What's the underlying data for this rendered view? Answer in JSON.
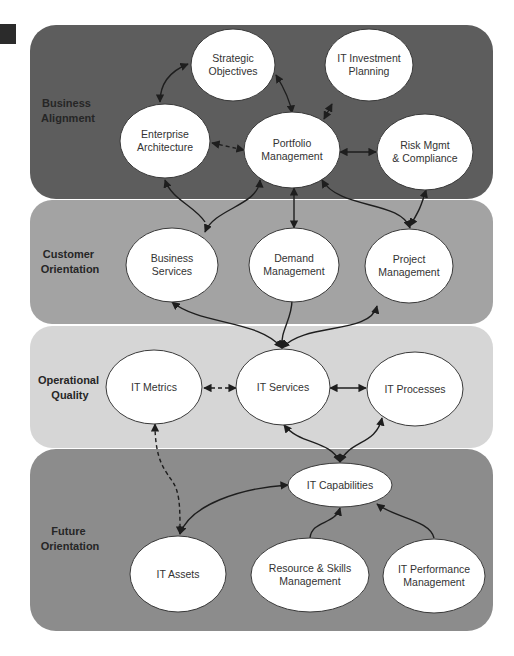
{
  "page": {
    "header_text": "Enterprise IT Management"
  },
  "colors": {
    "band_business": "#5d5d5d",
    "band_customer": "#a3a3a3",
    "band_operational": "#d6d6d6",
    "band_future": "#8c8c8c",
    "node_fill": "#ffffff",
    "arrow": "#1e1e1e"
  },
  "bands": [
    {
      "id": "business",
      "label_lines": [
        "Business",
        "Alignment"
      ]
    },
    {
      "id": "customer",
      "label_lines": [
        "Customer",
        "Orientation"
      ]
    },
    {
      "id": "operational",
      "label_lines": [
        "Operational",
        "Quality"
      ]
    },
    {
      "id": "future",
      "label_lines": [
        "Future",
        "Orientation"
      ]
    }
  ],
  "nodes": {
    "strategic_objectives": {
      "lines": [
        "Strategic",
        "Objectives"
      ]
    },
    "it_investment_planning": {
      "lines": [
        "IT Investment",
        "Planning"
      ]
    },
    "enterprise_architecture": {
      "lines": [
        "Enterprise",
        "Architecture"
      ]
    },
    "portfolio_management": {
      "lines": [
        "Portfolio",
        "Management"
      ]
    },
    "risk_mgmt_compliance": {
      "lines": [
        "Risk Mgmt",
        "& Compliance"
      ]
    },
    "business_services": {
      "lines": [
        "Business",
        "Services"
      ]
    },
    "demand_management": {
      "lines": [
        "Demand",
        "Management"
      ]
    },
    "project_management": {
      "lines": [
        "Project",
        "Management"
      ]
    },
    "it_metrics": {
      "lines": [
        "IT Metrics"
      ]
    },
    "it_services": {
      "lines": [
        "IT Services"
      ]
    },
    "it_processes": {
      "lines": [
        "IT Processes"
      ]
    },
    "it_capabilities": {
      "lines": [
        "IT Capabilities"
      ]
    },
    "it_assets": {
      "lines": [
        "IT Assets"
      ]
    },
    "resource_skills_management": {
      "lines": [
        "Resource & Skills",
        "Management"
      ]
    },
    "it_performance_management": {
      "lines": [
        "IT Performance",
        "Management"
      ]
    }
  },
  "edges": [
    {
      "from": "strategic_objectives",
      "to": "enterprise_architecture",
      "style": "solid",
      "direction": "both"
    },
    {
      "from": "strategic_objectives",
      "to": "portfolio_management",
      "style": "solid",
      "direction": "both"
    },
    {
      "from": "portfolio_management",
      "to": "it_investment_planning",
      "style": "solid",
      "direction": "both"
    },
    {
      "from": "enterprise_architecture",
      "to": "portfolio_management",
      "style": "dashed",
      "direction": "both"
    },
    {
      "from": "portfolio_management",
      "to": "risk_mgmt_compliance",
      "style": "solid",
      "direction": "both"
    },
    {
      "from": "business_services",
      "to": "enterprise_architecture",
      "style": "solid",
      "direction": "forward"
    },
    {
      "from": "business_services",
      "to": "portfolio_management",
      "style": "solid",
      "direction": "both"
    },
    {
      "from": "portfolio_management",
      "to": "demand_management",
      "style": "solid",
      "direction": "both"
    },
    {
      "from": "portfolio_management",
      "to": "project_management",
      "style": "solid",
      "direction": "both"
    },
    {
      "from": "project_management",
      "to": "risk_mgmt_compliance",
      "style": "solid",
      "direction": "both"
    },
    {
      "from": "demand_management",
      "to": "it_services",
      "style": "solid",
      "direction": "forward"
    },
    {
      "from": "it_services",
      "to": "business_services",
      "style": "solid",
      "direction": "both"
    },
    {
      "from": "it_services",
      "to": "project_management",
      "style": "solid",
      "direction": "both"
    },
    {
      "from": "it_metrics",
      "to": "it_services",
      "style": "dashed",
      "direction": "both"
    },
    {
      "from": "it_services",
      "to": "it_processes",
      "style": "solid",
      "direction": "both"
    },
    {
      "from": "it_capabilities",
      "to": "it_services",
      "style": "solid",
      "direction": "both"
    },
    {
      "from": "it_capabilities",
      "to": "it_processes",
      "style": "solid",
      "direction": "both"
    },
    {
      "from": "it_metrics",
      "to": "it_assets",
      "style": "dashed",
      "direction": "both"
    },
    {
      "from": "it_assets",
      "to": "it_capabilities",
      "style": "solid",
      "direction": "both"
    },
    {
      "from": "resource_skills_management",
      "to": "it_capabilities",
      "style": "solid",
      "direction": "forward"
    },
    {
      "from": "it_performance_management",
      "to": "it_capabilities",
      "style": "solid",
      "direction": "forward"
    }
  ]
}
